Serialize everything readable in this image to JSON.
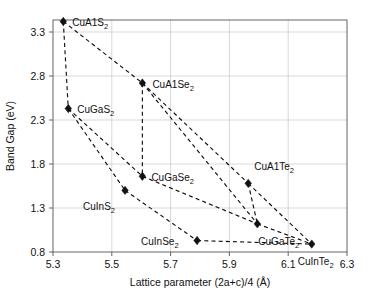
{
  "chart_data": {
    "type": "scatter",
    "title": "",
    "xlabel": "Lattice parameter (2a+c)/4 (Å)",
    "ylabel": "Band Gap (eV)",
    "xlim": [
      5.3,
      6.3
    ],
    "ylim": [
      0.8,
      3.4
    ],
    "xticks": [
      "5.3",
      "5.5",
      "5.7",
      "5.9",
      "6.1",
      "6.3"
    ],
    "xtick_values": [
      5.3,
      5.5,
      5.7,
      5.9,
      6.1,
      6.3
    ],
    "yticks": [
      "0.8",
      "1.3",
      "1.8",
      "2.3",
      "2.8",
      "3.3"
    ],
    "ytick_values": [
      0.8,
      1.3,
      1.8,
      2.3,
      2.8,
      3.3
    ],
    "grid": true,
    "legend": "none",
    "marker_style": "filled-diamond",
    "line_style": "dashed",
    "points": [
      {
        "label": "CuAlS",
        "label_base": "CuA1S",
        "sub": "2",
        "x": 5.335,
        "y": 3.42,
        "label_dx": 9,
        "label_dy": 5
      },
      {
        "label": "CuGaS",
        "label_base": "CuGaS",
        "sub": "2",
        "x": 5.352,
        "y": 2.43,
        "label_dx": 9,
        "label_dy": 4
      },
      {
        "label": "CuAlSe",
        "label_base": "CuA1Se",
        "sub": "2",
        "x": 5.604,
        "y": 2.72,
        "label_dx": 10,
        "label_dy": 5
      },
      {
        "label": "CuGaSe",
        "label_base": "CuGaSe",
        "sub": "2",
        "x": 5.604,
        "y": 1.66,
        "label_dx": 9,
        "label_dy": 5
      },
      {
        "label": "CuInS",
        "label_base": "CuInS",
        "sub": "2",
        "x": 5.545,
        "y": 1.5,
        "label_dx": -42,
        "label_dy": 20
      },
      {
        "label": "CuAlTe",
        "label_base": "CuA1Te",
        "sub": "2",
        "x": 5.964,
        "y": 1.58,
        "label_dx": 6,
        "label_dy": -13
      },
      {
        "label": "CuGaTe",
        "label_base": "CuGaTe",
        "sub": "2",
        "x": 5.995,
        "y": 1.12,
        "label_dx": 1,
        "label_dy": 21
      },
      {
        "label": "CuInSe",
        "label_base": "CuInSe",
        "sub": "2",
        "x": 5.79,
        "y": 0.93,
        "label_dx": -56,
        "label_dy": 4
      },
      {
        "label": "CuInTe",
        "label_base": "CuInTe",
        "sub": "2",
        "x": 6.18,
        "y": 0.89,
        "label_dx": -14,
        "label_dy": 21
      }
    ],
    "edges": [
      [
        "CuAlS",
        "CuGaS"
      ],
      [
        "CuAlS",
        "CuAlSe"
      ],
      [
        "CuAlSe",
        "CuAlTe"
      ],
      [
        "CuAlSe",
        "CuGaSe"
      ],
      [
        "CuAlSe",
        "CuGaTe"
      ],
      [
        "CuAlTe",
        "CuGaTe"
      ],
      [
        "CuAlTe",
        "CuInTe"
      ],
      [
        "CuGaS",
        "CuGaSe"
      ],
      [
        "CuGaS",
        "CuInS"
      ],
      [
        "CuGaSe",
        "CuGaTe"
      ],
      [
        "CuGaTe",
        "CuInTe"
      ],
      [
        "CuInS",
        "CuInSe"
      ],
      [
        "CuInSe",
        "CuInTe"
      ]
    ]
  }
}
